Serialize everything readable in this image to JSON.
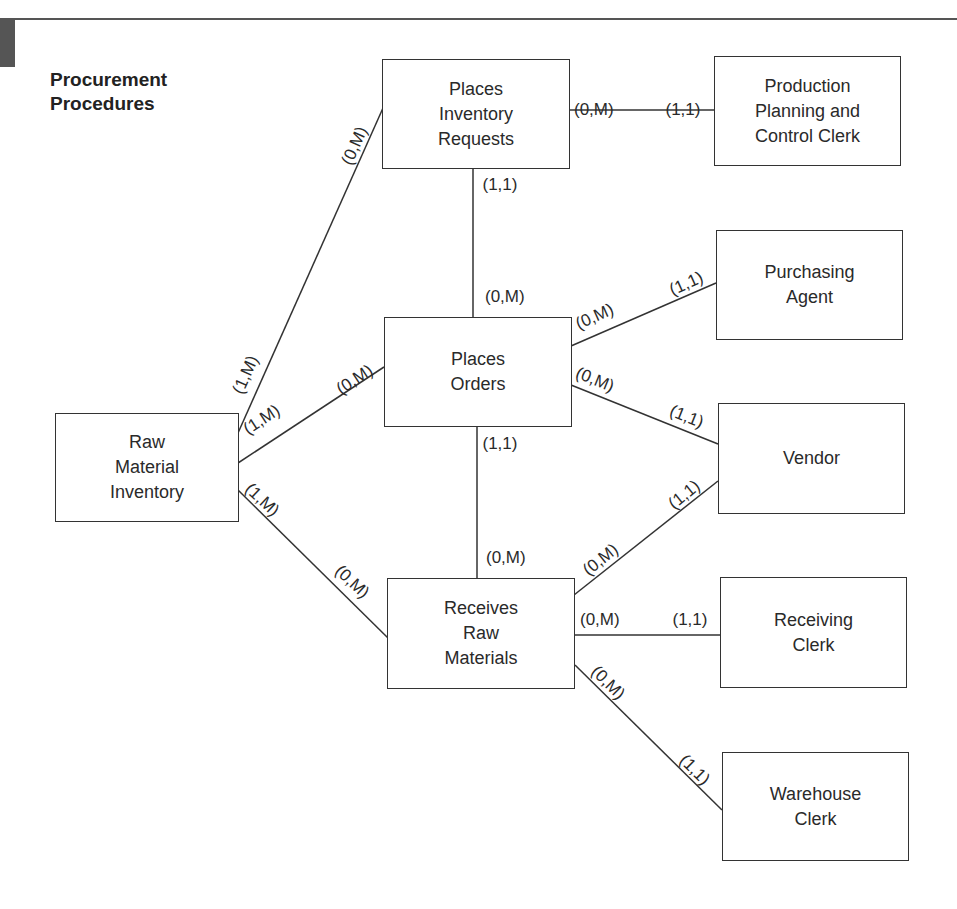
{
  "title": "Procurement\nProcedures",
  "colors": {
    "line": "#333333",
    "text": "#2a2a2a",
    "tab": "#555555"
  },
  "entities": [
    {
      "id": "raw_material_inventory",
      "label": "Raw\nMaterial\nInventory",
      "x": 55,
      "y": 413,
      "w": 184,
      "h": 109
    },
    {
      "id": "places_inventory_requests",
      "label": "Places\nInventory\nRequests",
      "x": 382,
      "y": 59,
      "w": 188,
      "h": 110
    },
    {
      "id": "places_orders",
      "label": "Places\nOrders",
      "x": 384,
      "y": 317,
      "w": 188,
      "h": 110
    },
    {
      "id": "receives_raw_materials",
      "label": "Receives\nRaw\nMaterials",
      "x": 387,
      "y": 578,
      "w": 188,
      "h": 111
    },
    {
      "id": "production_planning_control_clerk",
      "label": "Production\nPlanning and\nControl Clerk",
      "x": 714,
      "y": 56,
      "w": 187,
      "h": 110
    },
    {
      "id": "purchasing_agent",
      "label": "Purchasing\nAgent",
      "x": 716,
      "y": 230,
      "w": 187,
      "h": 110
    },
    {
      "id": "vendor",
      "label": "Vendor",
      "x": 718,
      "y": 403,
      "w": 187,
      "h": 111
    },
    {
      "id": "receiving_clerk",
      "label": "Receiving\nClerk",
      "x": 720,
      "y": 577,
      "w": 187,
      "h": 111
    },
    {
      "id": "warehouse_clerk",
      "label": "Warehouse\nClerk",
      "x": 722,
      "y": 752,
      "w": 187,
      "h": 109
    }
  ],
  "relationships": [
    {
      "from": "raw_material_inventory",
      "to": "places_inventory_requests",
      "x1": 238,
      "y1": 433,
      "x2": 383,
      "y2": 108
    },
    {
      "from": "raw_material_inventory",
      "to": "places_orders",
      "x1": 238,
      "y1": 463,
      "x2": 384,
      "y2": 367
    },
    {
      "from": "raw_material_inventory",
      "to": "receives_raw_materials",
      "x1": 238,
      "y1": 490,
      "x2": 388,
      "y2": 638
    },
    {
      "from": "places_inventory_requests",
      "to": "production_planning_control_clerk",
      "x1": 569,
      "y1": 110,
      "x2": 714,
      "y2": 110
    },
    {
      "from": "places_inventory_requests",
      "to": "places_orders",
      "x1": 473,
      "y1": 168,
      "x2": 473,
      "y2": 317
    },
    {
      "from": "places_orders",
      "to": "purchasing_agent",
      "x1": 571,
      "y1": 346,
      "x2": 716,
      "y2": 283
    },
    {
      "from": "places_orders",
      "to": "vendor",
      "x1": 571,
      "y1": 385,
      "x2": 718,
      "y2": 444
    },
    {
      "from": "places_orders",
      "to": "receives_raw_materials",
      "x1": 477,
      "y1": 426,
      "x2": 477,
      "y2": 578
    },
    {
      "from": "receives_raw_materials",
      "to": "vendor",
      "x1": 574,
      "y1": 595,
      "x2": 718,
      "y2": 481
    },
    {
      "from": "receives_raw_materials",
      "to": "receiving_clerk",
      "x1": 574,
      "y1": 635,
      "x2": 720,
      "y2": 635
    },
    {
      "from": "receives_raw_materials",
      "to": "warehouse_clerk",
      "x1": 575,
      "y1": 665,
      "x2": 722,
      "y2": 810
    }
  ],
  "cardinalities": [
    {
      "text": "(0,M)",
      "x": 355,
      "y": 146,
      "rot": -66
    },
    {
      "text": "(1,M)",
      "x": 246,
      "y": 375,
      "rot": -66
    },
    {
      "text": "(0,M)",
      "x": 355,
      "y": 380,
      "rot": -33
    },
    {
      "text": "(1,M)",
      "x": 262,
      "y": 420,
      "rot": -33
    },
    {
      "text": "(1,M)",
      "x": 262,
      "y": 500,
      "rot": 43
    },
    {
      "text": "(0,M)",
      "x": 352,
      "y": 582,
      "rot": 43
    },
    {
      "text": "(0,M)",
      "x": 594,
      "y": 110,
      "rot": 0
    },
    {
      "text": "(1,1)",
      "x": 683,
      "y": 110,
      "rot": 0
    },
    {
      "text": "(1,1)",
      "x": 500,
      "y": 185,
      "rot": 0
    },
    {
      "text": "(0,M)",
      "x": 505,
      "y": 297,
      "rot": 0
    },
    {
      "text": "(0,M)",
      "x": 595,
      "y": 317,
      "rot": -24
    },
    {
      "text": "(1,1)",
      "x": 686,
      "y": 284,
      "rot": -24
    },
    {
      "text": "(0,M)",
      "x": 595,
      "y": 380,
      "rot": 22
    },
    {
      "text": "(1,1)",
      "x": 686,
      "y": 417,
      "rot": 22
    },
    {
      "text": "(1,1)",
      "x": 500,
      "y": 444,
      "rot": 0
    },
    {
      "text": "(0,M)",
      "x": 506,
      "y": 558,
      "rot": 0
    },
    {
      "text": "(0,M)",
      "x": 601,
      "y": 560,
      "rot": -39
    },
    {
      "text": "(1,1)",
      "x": 684,
      "y": 495,
      "rot": -39
    },
    {
      "text": "(0,M)",
      "x": 600,
      "y": 620,
      "rot": 0
    },
    {
      "text": "(1,1)",
      "x": 690,
      "y": 620,
      "rot": 0
    },
    {
      "text": "(0,M)",
      "x": 608,
      "y": 683,
      "rot": 45
    },
    {
      "text": "(1,1)",
      "x": 694,
      "y": 770,
      "rot": 45
    }
  ]
}
